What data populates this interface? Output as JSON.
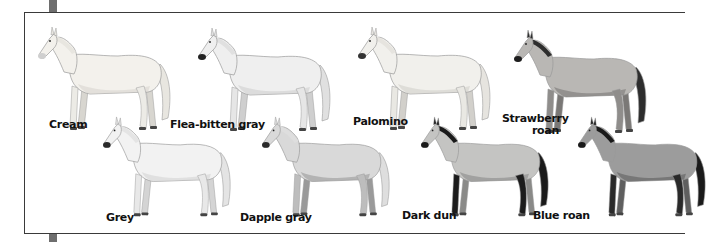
{
  "figure": {
    "frame_color": "#3a3a3a",
    "tab_color": "#6e6e6e",
    "horses": [
      {
        "name": "Cream",
        "coat": "#f3f1ec",
        "shade": "#d8d6d0",
        "mane": "#e8e6e0",
        "muzzle": "#cfcfcf",
        "legs": "#ecebe6",
        "row": "back"
      },
      {
        "name": "Flea-bitten gray",
        "coat": "#efefef",
        "shade": "#cfcfcf",
        "mane": "#e0e0e0",
        "muzzle": "#222222",
        "legs": "#e6e6e6",
        "row": "back"
      },
      {
        "name": "Palomino",
        "coat": "#f1f0ec",
        "shade": "#d2d0cb",
        "mane": "#e6e4df",
        "muzzle": "#333333",
        "legs": "#e9e8e3",
        "row": "back"
      },
      {
        "name": "Strawberry roan",
        "label_lines": [
          "Strawberry",
          "roan"
        ],
        "coat": "#b9b7b4",
        "shade": "#7a7876",
        "mane": "#2d2d2d",
        "muzzle": "#1e1e1e",
        "legs": "#8f8d8b",
        "row": "back"
      },
      {
        "name": "Grey",
        "coat": "#f2f2f2",
        "shade": "#d4d4d4",
        "mane": "#e4e4e4",
        "muzzle": "#2a2a2a",
        "legs": "#e8e8e8",
        "row": "front"
      },
      {
        "name": "Dapple gray",
        "coat": "#d9d9d9",
        "shade": "#9a9a9a",
        "mane": "#dedede",
        "muzzle": "#2a2a2a",
        "legs": "#bdbdbd",
        "row": "front"
      },
      {
        "name": "Dark dun",
        "coat": "#c4c4c2",
        "shade": "#8a8a88",
        "mane": "#1a1a1a",
        "muzzle": "#1a1a1a",
        "legs": "#1c1c1c",
        "row": "front"
      },
      {
        "name": "Blue roan",
        "coat": "#9c9c9c",
        "shade": "#5f5f5f",
        "mane": "#1a1a1a",
        "muzzle": "#1a1a1a",
        "legs": "#2a2a2a",
        "row": "front"
      }
    ]
  }
}
